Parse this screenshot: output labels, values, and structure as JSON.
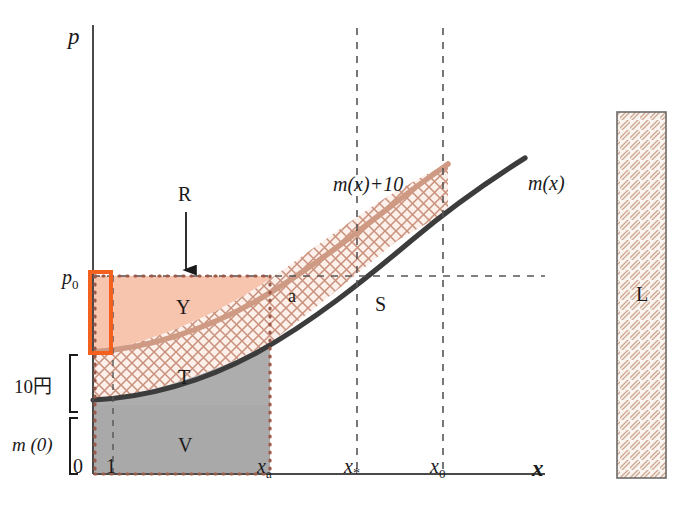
{
  "figure": {
    "type": "economics-diagram",
    "background": "#ffffff",
    "top_cut_text": "",
    "axes": {
      "y_label": "p",
      "x_label": "x",
      "origin_label": "0"
    },
    "x_ticks": [
      {
        "id": "one",
        "label": "1",
        "sub": ""
      },
      {
        "id": "xa",
        "label": "x",
        "sub": "a"
      },
      {
        "id": "xstar",
        "label": "x",
        "sub": "*"
      },
      {
        "id": "x0",
        "label": "x",
        "sub": "0"
      }
    ],
    "y_ticks": [
      {
        "id": "p0",
        "label": "p",
        "sub": "0"
      }
    ],
    "brackets": [
      {
        "id": "ten-yen",
        "label": "10円"
      },
      {
        "id": "m-zero",
        "label": "m (0)"
      }
    ],
    "curves": [
      {
        "id": "m-shift",
        "label": "m(x)+10",
        "color": "#c08a74"
      },
      {
        "id": "m-base",
        "label": "m(x)",
        "color": "#3c3c3c"
      }
    ],
    "regions": [
      {
        "id": "Y",
        "label": "Y",
        "fill": "#f7c4ae"
      },
      {
        "id": "T",
        "label": "T",
        "fill": "crosshatch"
      },
      {
        "id": "V",
        "label": "V",
        "fill": "#a8a8a8"
      },
      {
        "id": "S",
        "label": "S",
        "fill": "crosshatch"
      },
      {
        "id": "a",
        "label": "a",
        "fill": "none"
      },
      {
        "id": "L",
        "label": "L",
        "fill": "diagonal-hatch"
      }
    ],
    "annotations": [
      {
        "id": "R",
        "label": "R",
        "kind": "arrow-pointer"
      }
    ],
    "colors": {
      "orange_highlight": "#f4601e",
      "dotted_boundary": "#9a5a4a",
      "hatch": "#c9917c",
      "curve_dark": "#3c3c3c",
      "curve_light": "#c08a74",
      "region_y": "#f7c4ae",
      "region_v": "#a8a8a8",
      "axis": "#4a4a4a",
      "dash": "#5a5a5a"
    }
  }
}
